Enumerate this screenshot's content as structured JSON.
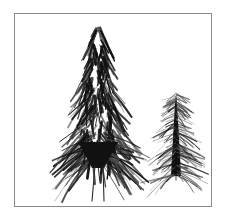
{
  "figure": {
    "kind": "botanical-line-illustration",
    "background_color": "#ffffff",
    "ink_color": "#111111",
    "frame": {
      "color": "#8a8a8a",
      "x": 14,
      "y": 13,
      "width": 198,
      "height": 194,
      "stroke_width": 1
    },
    "canvas": {
      "width": 226,
      "height": 224
    }
  },
  "specimens": [
    {
      "id": "large-spikelet",
      "name": "large-bristly-seed-head",
      "description": "dense ovoid lanceolate bristly inflorescence",
      "apex": {
        "x": 98,
        "y": 27
      },
      "base": {
        "x": 99,
        "y": 168
      },
      "half_width_max": 38,
      "widest_at_y": 128,
      "bristle_count": 230,
      "bristle_length_min": 10,
      "bristle_length_max": 34,
      "flare_bristle_count": 46,
      "stems": [
        {
          "x_top": 95,
          "y_top": 166,
          "x_bottom": 92,
          "y_bottom": 201
        },
        {
          "x_top": 103,
          "y_top": 166,
          "x_bottom": 104,
          "y_bottom": 201
        }
      ],
      "stem_width": 1.1
    },
    {
      "id": "small-spikelet",
      "name": "small-dark-spike",
      "description": "narrow dark wedge spike with fine radiating hairs",
      "apex": {
        "x": 176,
        "y": 92
      },
      "base": {
        "x": 176,
        "y": 176
      },
      "half_width_max": 7,
      "widest_at_y": 172,
      "bristle_count": 150,
      "bristle_length_min": 7,
      "bristle_length_max": 26,
      "stem_width": 0.9
    }
  ],
  "labels": {
    "plate_title": "",
    "figure_caption": ""
  }
}
